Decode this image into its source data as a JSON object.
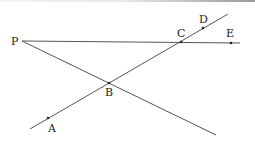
{
  "diagram": {
    "type": "geometry",
    "stroke_color": "#555555",
    "points": [
      {
        "name": "P",
        "label": "P",
        "x": 22,
        "y": 41,
        "lx": 11,
        "ly": 45
      },
      {
        "name": "A",
        "label": "A",
        "x": 48,
        "y": 118,
        "lx": 48,
        "ly": 132
      },
      {
        "name": "B",
        "label": "B",
        "x": 109,
        "y": 83,
        "lx": 105,
        "ly": 96
      },
      {
        "name": "C",
        "label": "C",
        "x": 181,
        "y": 42,
        "lx": 177,
        "ly": 37
      },
      {
        "name": "D",
        "label": "D",
        "x": 203,
        "y": 28,
        "lx": 199,
        "ly": 23
      },
      {
        "name": "E",
        "label": "E",
        "x": 231,
        "y": 43,
        "lx": 226,
        "ly": 37
      }
    ],
    "segments": [
      {
        "name": "line-PE",
        "from": "P",
        "to": "E",
        "x1": 22,
        "y1": 41,
        "x2": 240,
        "y2": 43
      },
      {
        "name": "line-AD",
        "from": "A",
        "to": "D",
        "x1": 30,
        "y1": 129,
        "x2": 228,
        "y2": 14
      },
      {
        "name": "line-PB",
        "from": "P",
        "to": "B",
        "x1": 22,
        "y1": 41,
        "x2": 216,
        "y2": 135
      }
    ]
  }
}
